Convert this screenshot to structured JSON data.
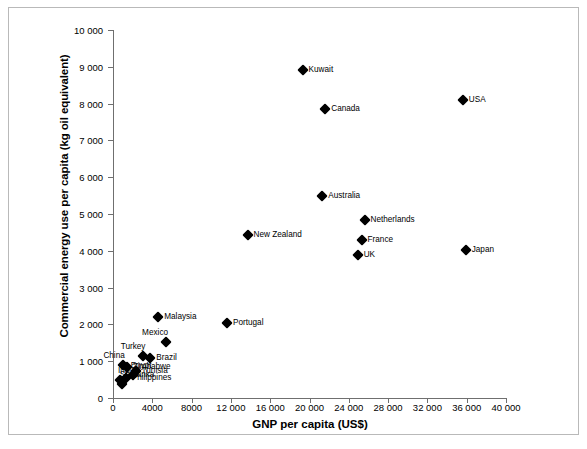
{
  "chart_data": {
    "type": "scatter",
    "title": "",
    "xlabel": "GNP per capita (US$)",
    "ylabel": "Commercial energy use per capita (kg oil equivalent)",
    "xlim": [
      0,
      40000
    ],
    "ylim": [
      0,
      10000
    ],
    "xticks": [
      0,
      4000,
      8000,
      12000,
      16000,
      20000,
      24000,
      28000,
      32000,
      36000,
      40000
    ],
    "xtick_labels": [
      "0",
      "4000",
      "8000",
      "12 000",
      "16 000",
      "20 000",
      "24 000",
      "28 000",
      "32 000",
      "36 000",
      "40 000"
    ],
    "yticks": [
      0,
      1000,
      2000,
      3000,
      4000,
      5000,
      6000,
      7000,
      8000,
      9000,
      10000
    ],
    "ytick_labels": [
      "0",
      "1 000",
      "2 000",
      "3 000",
      "4 000",
      "5 000",
      "6 000",
      "7 000",
      "8 000",
      "9 000",
      "10 000"
    ],
    "grid": false,
    "legend": false,
    "marker": "diamond",
    "marker_color": "#000000",
    "points": [
      {
        "label": "Kuwait",
        "x": 19300,
        "y": 8900,
        "label_pos": "right"
      },
      {
        "label": "Canada",
        "x": 21600,
        "y": 7850,
        "label_pos": "right"
      },
      {
        "label": "USA",
        "x": 35600,
        "y": 8100,
        "label_pos": "right"
      },
      {
        "label": "Australia",
        "x": 21300,
        "y": 5480,
        "label_pos": "right"
      },
      {
        "label": "Netherlands",
        "x": 25600,
        "y": 4830,
        "label_pos": "right"
      },
      {
        "label": "France",
        "x": 25300,
        "y": 4290,
        "label_pos": "right"
      },
      {
        "label": "UK",
        "x": 24900,
        "y": 3880,
        "label_pos": "right"
      },
      {
        "label": "Japan",
        "x": 35900,
        "y": 4030,
        "label_pos": "right"
      },
      {
        "label": "New Zealand",
        "x": 13700,
        "y": 4420,
        "label_pos": "right"
      },
      {
        "label": "Malaysia",
        "x": 4600,
        "y": 2200,
        "label_pos": "right"
      },
      {
        "label": "Portugal",
        "x": 11600,
        "y": 2050,
        "label_pos": "right"
      },
      {
        "label": "Mexico",
        "x": 5400,
        "y": 1510,
        "label_pos": "above-left"
      },
      {
        "label": "Turkey",
        "x": 3100,
        "y": 1150,
        "label_pos": "above-left"
      },
      {
        "label": "Brazil",
        "x": 3800,
        "y": 1080,
        "label_pos": "right"
      },
      {
        "label": "China",
        "x": 1000,
        "y": 900,
        "label_pos": "above-left"
      },
      {
        "label": "Zimbabwe",
        "x": 1400,
        "y": 830,
        "label_pos": "right"
      },
      {
        "label": "Tunisia",
        "x": 2300,
        "y": 740,
        "label_pos": "right"
      },
      {
        "label": "Egypt",
        "x": 2000,
        "y": 630,
        "label_pos": "above"
      },
      {
        "label": "Philippines",
        "x": 1300,
        "y": 540,
        "label_pos": "right"
      },
      {
        "label": "India",
        "x": 700,
        "y": 480,
        "label_pos": "above"
      },
      {
        "label": "Sri Lanka",
        "x": 900,
        "y": 380,
        "label_pos": "above"
      }
    ]
  }
}
